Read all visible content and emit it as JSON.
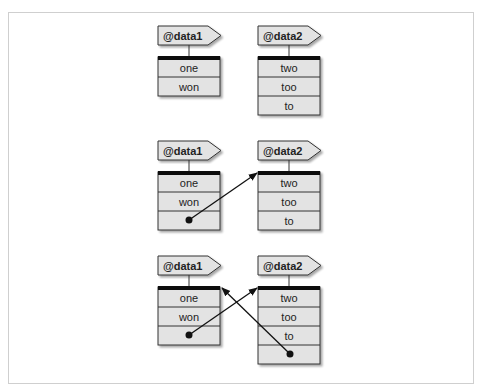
{
  "diagram": {
    "colors": {
      "cell_fill": "#e3e3e3",
      "border": "#333333",
      "header_bar": "#111111",
      "frame": "#cfcfcf",
      "arrow": "#111111"
    },
    "panels": [
      {
        "data1": {
          "name": "@data1",
          "cells": [
            "one",
            "won"
          ]
        },
        "data2": {
          "name": "@data2",
          "cells": [
            "two",
            "too",
            "to"
          ]
        },
        "arrows": []
      },
      {
        "data1": {
          "name": "@data1",
          "cells": [
            "one",
            "won",
            ""
          ]
        },
        "data2": {
          "name": "@data2",
          "cells": [
            "two",
            "too",
            "to"
          ]
        },
        "arrows": [
          {
            "from": "@data1[2]",
            "to": "@data2"
          }
        ]
      },
      {
        "data1": {
          "name": "@data1",
          "cells": [
            "one",
            "won",
            ""
          ]
        },
        "data2": {
          "name": "@data2",
          "cells": [
            "two",
            "too",
            "to",
            ""
          ]
        },
        "arrows": [
          {
            "from": "@data1[2]",
            "to": "@data2"
          },
          {
            "from": "@data2[3]",
            "to": "@data1"
          }
        ]
      }
    ]
  }
}
